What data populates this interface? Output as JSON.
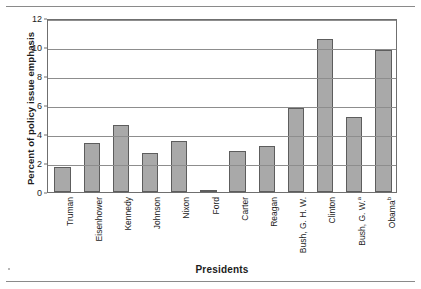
{
  "chart_data": {
    "type": "bar",
    "title": "",
    "xlabel": "Presidents",
    "ylabel": "Percent of policy issue emphasis",
    "categories": [
      "Truman",
      "Eisenhower",
      "Kennedy",
      "Johnson",
      "Nixon",
      "Ford",
      "Carter",
      "Reagan",
      "Bush, G. H. W.",
      "Clinton",
      "Bush, G. W.",
      "Obama"
    ],
    "category_superscripts": [
      "",
      "",
      "",
      "",
      "",
      "",
      "",
      "",
      "",
      "",
      "a",
      "b"
    ],
    "values": [
      1.72,
      3.35,
      4.65,
      2.7,
      3.55,
      0.05,
      2.8,
      3.2,
      5.8,
      10.55,
      5.2,
      9.8
    ],
    "ylim": [
      0,
      12
    ],
    "ytick_values": [
      0,
      2,
      4,
      6,
      8,
      10,
      12
    ],
    "ytick_labels": [
      "0",
      "2",
      "4",
      "6",
      "8",
      "10",
      "12"
    ],
    "grid": true,
    "grid_axis": "y",
    "legend": false,
    "bar_color": "#a9a9a9",
    "bar_edge_color": "#5d5d5d",
    "frame_color": "#6f6f6f"
  }
}
